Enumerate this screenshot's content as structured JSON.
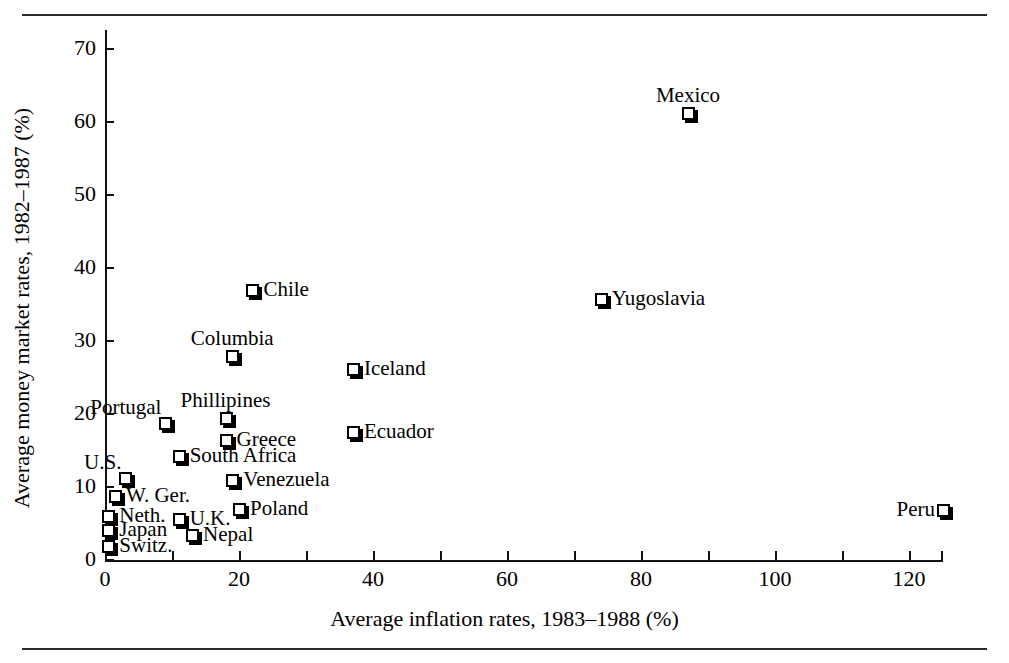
{
  "figure": {
    "x_axis_title": "Average inflation rates, 1983–1988 (%)",
    "y_axis_title": "Average money market rates, 1982–1987 (%)",
    "marker_shape": "square-3d",
    "marker_color": "#000000",
    "background_color": "#ffffff"
  },
  "chart_data": {
    "type": "scatter",
    "title": "",
    "xlabel": "Average inflation rates, 1983–1988 (%)",
    "ylabel": "Average money market rates, 1982–1987 (%)",
    "xlim": [
      0,
      126
    ],
    "ylim": [
      0,
      72
    ],
    "xticks": [
      0,
      20,
      40,
      60,
      80,
      100,
      120
    ],
    "xticks_minor": [
      10,
      30,
      50,
      70,
      90,
      110
    ],
    "yticks": [
      0,
      10,
      20,
      30,
      40,
      50,
      60,
      70
    ],
    "grid": false,
    "legend": "none",
    "points": [
      {
        "name": "Mexico",
        "x": 87,
        "y": 61.2,
        "label_pos": "above"
      },
      {
        "name": "Yugoslavia",
        "x": 74,
        "y": 35.8,
        "label_pos": "right"
      },
      {
        "name": "Chile",
        "x": 22,
        "y": 37.0,
        "label_pos": "right"
      },
      {
        "name": "Columbia",
        "x": 19,
        "y": 28.0,
        "label_pos": "above"
      },
      {
        "name": "Iceland",
        "x": 37,
        "y": 26.2,
        "label_pos": "right"
      },
      {
        "name": "Phillipines",
        "x": 18,
        "y": 19.4,
        "label_pos": "above"
      },
      {
        "name": "Portugal",
        "x": 9,
        "y": 18.7,
        "label_pos": "above-left"
      },
      {
        "name": "Ecuador",
        "x": 37,
        "y": 17.6,
        "label_pos": "right"
      },
      {
        "name": "Greece",
        "x": 18,
        "y": 16.4,
        "label_pos": "right"
      },
      {
        "name": "South Africa",
        "x": 11,
        "y": 14.2,
        "label_pos": "right"
      },
      {
        "name": "U.S.",
        "x": 3,
        "y": 11.3,
        "label_pos": "above-left"
      },
      {
        "name": "Venezuela",
        "x": 19,
        "y": 11.0,
        "label_pos": "right"
      },
      {
        "name": "W. Ger.",
        "x": 1.5,
        "y": 8.8,
        "label_pos": "right"
      },
      {
        "name": "Poland",
        "x": 20,
        "y": 7.0,
        "label_pos": "right"
      },
      {
        "name": "Peru",
        "x": 125,
        "y": 6.8,
        "label_pos": "left"
      },
      {
        "name": "Neth.",
        "x": 0.5,
        "y": 6.0,
        "label_pos": "right"
      },
      {
        "name": "U.K.",
        "x": 11,
        "y": 5.6,
        "label_pos": "right"
      },
      {
        "name": "Japan",
        "x": 0.5,
        "y": 4.1,
        "label_pos": "right"
      },
      {
        "name": "Nepal",
        "x": 13,
        "y": 3.4,
        "label_pos": "right"
      },
      {
        "name": "Switz.",
        "x": 0.5,
        "y": 1.9,
        "label_pos": "right"
      }
    ]
  },
  "axis": {
    "x_tick_labels": [
      "0",
      "20",
      "40",
      "60",
      "80",
      "100",
      "120"
    ],
    "y_tick_labels": [
      "0",
      "10",
      "20",
      "30",
      "40",
      "50",
      "60",
      "70"
    ]
  }
}
